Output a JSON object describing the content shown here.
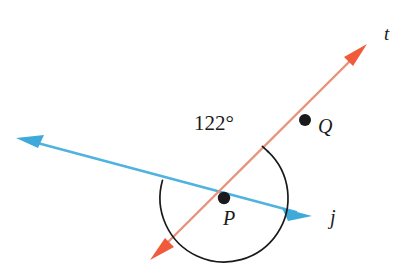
{
  "figure": {
    "background_color": "#ffffff"
  },
  "chart_data": {
    "type": "diagram",
    "title": "",
    "canvas": {
      "width": 410,
      "height": 279
    },
    "colors": {
      "line_j": "#4FB3DF",
      "line_t": "#E8745A",
      "arc": "#1a1a1a",
      "point": "#1a1a1a",
      "label": "#1a1a1a"
    },
    "lines": [
      {
        "name": "j",
        "label": "j",
        "color": "#4FB3DF",
        "stroke_width": 2.6,
        "arrow_start": true,
        "arrow_end": true,
        "start": {
          "x": 16,
          "y": 138
        },
        "end": {
          "x": 312,
          "y": 216
        }
      },
      {
        "name": "t",
        "label": "t",
        "color": "#E8745A",
        "stroke_width": 2.4,
        "arrow_start": true,
        "arrow_end": true,
        "start": {
          "x": 150,
          "y": 260
        },
        "end": {
          "x": 367,
          "y": 44
        }
      }
    ],
    "points": [
      {
        "name": "P",
        "label": "P",
        "x": 224,
        "y": 198,
        "radius": 6.2,
        "label_x": 229,
        "label_y": 225
      },
      {
        "name": "Q",
        "label": "Q",
        "x": 305,
        "y": 120,
        "radius": 6.0,
        "label_x": 318,
        "label_y": 133
      }
    ],
    "angle": {
      "value": 122,
      "label": "122°",
      "unit": "degrees",
      "vertex": "P",
      "between": [
        "j",
        "t"
      ],
      "label_x": 214,
      "label_y": 130,
      "arc_radius": 64
    },
    "line_labels": [
      {
        "name": "t",
        "label": "t",
        "x": 384,
        "y": 40
      },
      {
        "name": "j",
        "label": "j",
        "x": 330,
        "y": 224
      }
    ]
  },
  "labels": {
    "angle_measure": "122°",
    "point_p": "P",
    "point_q": "Q",
    "line_j": "j",
    "line_t": "t"
  }
}
